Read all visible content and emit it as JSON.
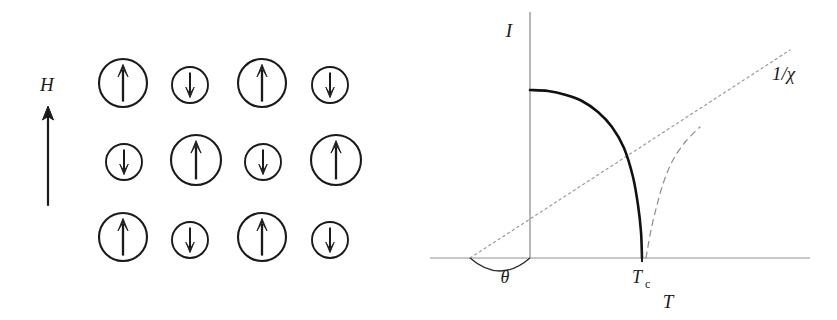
{
  "figure": {
    "background_color": "#ffffff",
    "ink_color": "#1a1a1a",
    "faint_color": "#8c8c8c"
  },
  "left_panel": {
    "name": "ferrimagnetic-spin-lattice",
    "field_label": "H",
    "field_arrow_direction": "up",
    "rows": [
      {
        "row_index": 1,
        "cells": [
          {
            "size": "large",
            "spin": "up",
            "glyph": "↑",
            "cx": 123,
            "cy": 83,
            "r": 24
          },
          {
            "size": "small",
            "spin": "down",
            "glyph": "↓",
            "cx": 190,
            "cy": 85,
            "r": 18
          },
          {
            "size": "large",
            "spin": "up",
            "glyph": "↑",
            "cx": 262,
            "cy": 83,
            "r": 24
          },
          {
            "size": "small",
            "spin": "down",
            "glyph": "↓",
            "cx": 330,
            "cy": 85,
            "r": 18
          }
        ]
      },
      {
        "row_index": 2,
        "cells": [
          {
            "size": "small",
            "spin": "down",
            "glyph": "↓",
            "cx": 124,
            "cy": 162,
            "r": 18
          },
          {
            "size": "large",
            "spin": "up",
            "glyph": "↑",
            "cx": 196,
            "cy": 160,
            "r": 25
          },
          {
            "size": "small",
            "spin": "down",
            "glyph": "↓",
            "cx": 263,
            "cy": 162,
            "r": 18
          },
          {
            "size": "large",
            "spin": "up",
            "glyph": "↑",
            "cx": 336,
            "cy": 160,
            "r": 25
          }
        ]
      },
      {
        "row_index": 3,
        "cells": [
          {
            "size": "large",
            "spin": "up",
            "glyph": "↑",
            "cx": 123,
            "cy": 237,
            "r": 24
          },
          {
            "size": "small",
            "spin": "down",
            "glyph": "↓",
            "cx": 190,
            "cy": 240,
            "r": 18
          },
          {
            "size": "large",
            "spin": "up",
            "glyph": "↑",
            "cx": 262,
            "cy": 237,
            "r": 24
          },
          {
            "size": "small",
            "spin": "down",
            "glyph": "↓",
            "cx": 330,
            "cy": 240,
            "r": 18
          }
        ]
      }
    ]
  },
  "chart_data": {
    "type": "line",
    "title": "",
    "xlabel": "T",
    "ylabel": "I",
    "axes": {
      "x_axis_label": "T",
      "y_axis_label": "I",
      "x_axis_from": 430,
      "x_axis_to": 810,
      "x_axis_y": 258,
      "y_axis_x": 530,
      "y_axis_from": 12,
      "y_axis_to": 258,
      "grid": false,
      "legend": "none"
    },
    "annotations": [
      {
        "name": "curie-temperature",
        "text": "T",
        "subscript": "c",
        "x": 642,
        "y": 258
      },
      {
        "name": "angle-theta",
        "text": "θ",
        "x": 505,
        "y": 277
      },
      {
        "name": "inverse-susceptibility",
        "text": "1/χ",
        "x": 778,
        "y": 73
      }
    ],
    "series": [
      {
        "name": "spontaneous-magnetisation",
        "label": "I",
        "style": "solid",
        "linewidth": 2.6,
        "description": "Spontaneous magnetisation I(T) falling to zero at Tc",
        "points": [
          [
            530,
            90
          ],
          [
            548,
            91
          ],
          [
            566,
            95
          ],
          [
            582,
            101
          ],
          [
            598,
            112
          ],
          [
            612,
            127
          ],
          [
            624,
            148
          ],
          [
            633,
            177
          ],
          [
            638,
            205
          ],
          [
            641,
            232
          ],
          [
            642,
            258
          ]
        ]
      },
      {
        "name": "inverse-susceptibility-line",
        "label": "1/χ",
        "style": "dotted",
        "linewidth": 1.2,
        "description": "Curie-Weiss asymptote 1/chi, straight line through the negative-T intercept",
        "points": [
          [
            470,
            258
          ],
          [
            790,
            50
          ]
        ]
      },
      {
        "name": "inverse-susceptibility-hyperbolic-branch",
        "label": "",
        "style": "dashed",
        "linewidth": 1.2,
        "description": "Hyperbolic 1/chi branch near Tc approaching the asymptote",
        "points": [
          [
            646,
            258
          ],
          [
            651,
            230
          ],
          [
            657,
            205
          ],
          [
            664,
            181
          ],
          [
            673,
            160
          ],
          [
            686,
            141
          ],
          [
            700,
            127
          ]
        ]
      }
    ],
    "angle_arc": {
      "name": "theta-arc",
      "description": "Arc marking angle theta between the 1/chi asymptote and the T axis",
      "from_x": 470,
      "from_y": 258,
      "to_x": 530,
      "to_y": 258,
      "sag": 26
    }
  }
}
